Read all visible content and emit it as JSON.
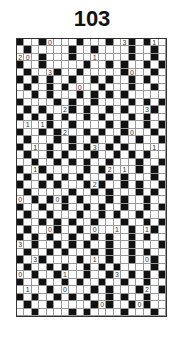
{
  "puzzle": {
    "title": "103",
    "cols": 20,
    "rows": 37,
    "colors": {
      "black": "#111111",
      "white": "#ffffff",
      "grid_line": "#999999"
    },
    "black_cells": [
      "B..B....B...B..B.B..",
      ".B.....B..B....B..B.",
      "...B...B..B....B..B.",
      "B..B.....B..B.B..B.B",
      ".B...B..B.....B...B.",
      "B.B.B..B..B.B..B.B..",
      ".B..B.B....B...B..B.",
      "..B.B...B.B.B.B.....",
      "B....B.B..B....B.B.B",
      ".B.B...B.B..B.B...B.",
      "B.B.B.B..B.B...B.B..",
      ".B..B..B....B.B..B.B",
      "B..B.B...B.B..B...B.",
      ".B...B.B..B..B..B..B",
      "B.B.B..B.B..B.B...B.",
      ".B..B.B...B..B.B.B..",
      "..B..B.B.B..B...B..B",
      "B..B.....B.B..B.B.B.",
      ".B..B.B.B...B.B...B.",
      "B..B.B...B.B..B.B..B",
      ".B.....B..B.B...B.B.",
      "..B.B.B.B...B.B..B..",
      "B..B..B..B.B..B..B.B",
      ".B..B...B..B.B..B...",
      "B..B.B.B..B...B..B.B",
      ".B...B..B....B.B..B.",
      "B.B.B..B..B.B..B.B..",
      "..B..B.B.B..B..B...B",
      ".B..B.B...B.B..B.B..",
      "B..B....B...B..B..B.",
      ".B..B.B..B.B.B....B.",
      "..B..B...B..B..B.B.B",
      "B..B..B.B..B..B..B..",
      ".B..B.B...B.B...B..B",
      "B.B..B.B.B..B.B..B..",
      ".B..B.....B.B..B.B..",
      "..B....B.B....B...B."
    ],
    "numbers": [
      {
        "r": 0,
        "c": 4,
        "v": "0"
      },
      {
        "r": 0,
        "c": 14,
        "v": "3"
      },
      {
        "r": 0,
        "c": 18,
        "v": "1"
      },
      {
        "r": 2,
        "c": 0,
        "v": "2"
      },
      {
        "r": 2,
        "c": 1,
        "v": "0"
      },
      {
        "r": 2,
        "c": 10,
        "v": "1"
      },
      {
        "r": 4,
        "c": 4,
        "v": "3"
      },
      {
        "r": 4,
        "c": 15,
        "v": "0"
      },
      {
        "r": 6,
        "c": 8,
        "v": "0"
      },
      {
        "r": 9,
        "c": 6,
        "v": "2"
      },
      {
        "r": 9,
        "c": 17,
        "v": "3"
      },
      {
        "r": 11,
        "c": 1,
        "v": "1"
      },
      {
        "r": 11,
        "c": 3,
        "v": "1"
      },
      {
        "r": 12,
        "c": 6,
        "v": "2"
      },
      {
        "r": 12,
        "c": 15,
        "v": "0"
      },
      {
        "r": 14,
        "c": 2,
        "v": "1"
      },
      {
        "r": 14,
        "c": 10,
        "v": "3"
      },
      {
        "r": 14,
        "c": 18,
        "v": "1"
      },
      {
        "r": 17,
        "c": 2,
        "v": "1"
      },
      {
        "r": 17,
        "c": 12,
        "v": "2"
      },
      {
        "r": 17,
        "c": 14,
        "v": "1"
      },
      {
        "r": 19,
        "c": 10,
        "v": "2"
      },
      {
        "r": 21,
        "c": 0,
        "v": "0"
      },
      {
        "r": 21,
        "c": 5,
        "v": "0"
      },
      {
        "r": 25,
        "c": 4,
        "v": "0"
      },
      {
        "r": 25,
        "c": 10,
        "v": "0"
      },
      {
        "r": 25,
        "c": 13,
        "v": "1"
      },
      {
        "r": 25,
        "c": 17,
        "v": "1"
      },
      {
        "r": 27,
        "c": 0,
        "v": "3"
      },
      {
        "r": 29,
        "c": 2,
        "v": "3"
      },
      {
        "r": 29,
        "c": 10,
        "v": "1"
      },
      {
        "r": 29,
        "c": 17,
        "v": "0"
      },
      {
        "r": 31,
        "c": 0,
        "v": "0"
      },
      {
        "r": 31,
        "c": 6,
        "v": "1"
      },
      {
        "r": 31,
        "c": 13,
        "v": "3"
      },
      {
        "r": 33,
        "c": 1,
        "v": "1"
      },
      {
        "r": 33,
        "c": 6,
        "v": "0"
      },
      {
        "r": 33,
        "c": 17,
        "v": "2"
      },
      {
        "r": 35,
        "c": 11,
        "v": "0"
      },
      {
        "r": 35,
        "c": 16,
        "v": "0"
      }
    ]
  }
}
